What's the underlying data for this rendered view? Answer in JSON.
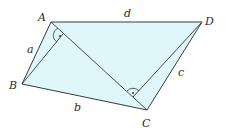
{
  "diagram": {
    "fill_color": "#dff6fa",
    "stroke_color": "#3a3a3a",
    "vertices": {
      "A": {
        "label": "A",
        "x": 51,
        "y": 22
      },
      "B": {
        "label": "B",
        "x": 22,
        "y": 84
      },
      "C": {
        "label": "C",
        "x": 147,
        "y": 110
      },
      "D": {
        "label": "D",
        "x": 202,
        "y": 22
      }
    },
    "sides": {
      "a": "a",
      "b": "b",
      "c": "c",
      "d": "d"
    },
    "right_angle_marks": [
      {
        "at": "foot of perpendicular from B to AC",
        "symbol": "·"
      },
      {
        "at": "foot of perpendicular from D to AC",
        "symbol": "·"
      }
    ]
  }
}
